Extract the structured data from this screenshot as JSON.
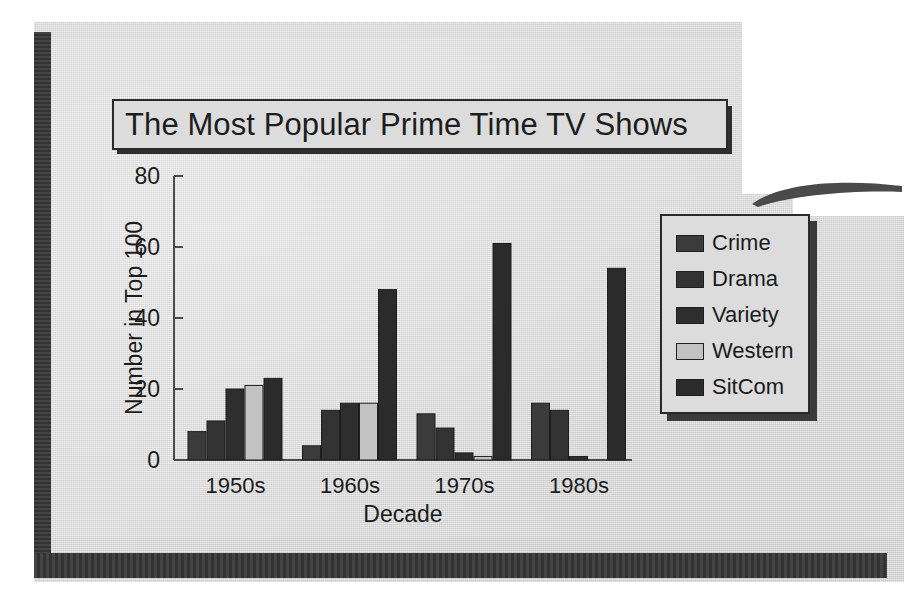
{
  "document": {
    "kind": "scanned-textbook-page",
    "paper_color": "#dedede",
    "edge_shadow_color": "#3a3a3a"
  },
  "title": {
    "text": "The Most Popular Prime Time TV Shows",
    "box_border_color": "#2a2a2a",
    "box_fill": "#dcdcdc",
    "shadow_color": "#2f2f2f"
  },
  "legend": {
    "position": "right",
    "border_color": "#2a2a2a",
    "fill": "#dcdcdc",
    "items": [
      {
        "label": "Crime",
        "color": "#3b3b3b"
      },
      {
        "label": "Drama",
        "color": "#333333"
      },
      {
        "label": "Variety",
        "color": "#2e2e2e"
      },
      {
        "label": "Western",
        "color": "#c2c2c2"
      },
      {
        "label": "SitCom",
        "color": "#2b2b2b"
      }
    ]
  },
  "chart_data": {
    "type": "bar",
    "title": "The Most Popular Prime Time TV Shows",
    "xlabel": "Decade",
    "ylabel": "Number in Top 100",
    "categories": [
      "1950s",
      "1960s",
      "1970s",
      "1980s"
    ],
    "ylim": [
      0,
      80
    ],
    "yticks": [
      0,
      20,
      40,
      60,
      80
    ],
    "ytick_labels": [
      "0",
      "20",
      "40",
      "60",
      "80"
    ],
    "grid": false,
    "legend_position": "right",
    "series": [
      {
        "name": "Crime",
        "color": "#3b3b3b",
        "values": [
          8,
          4,
          13,
          16
        ]
      },
      {
        "name": "Drama",
        "color": "#333333",
        "values": [
          11,
          14,
          9,
          14
        ]
      },
      {
        "name": "Variety",
        "color": "#2e2e2e",
        "values": [
          20,
          16,
          2,
          1
        ]
      },
      {
        "name": "Western",
        "color": "#c2c2c2",
        "values": [
          21,
          16,
          1,
          0
        ]
      },
      {
        "name": "SitCom",
        "color": "#2b2b2b",
        "values": [
          23,
          48,
          61,
          54
        ]
      }
    ]
  },
  "axes": {
    "y_axis_label": "Number in Top 100",
    "x_axis_label": "Decade",
    "tick_color": "#3a3a3a",
    "axis_line_color": "#4a4a4a"
  }
}
